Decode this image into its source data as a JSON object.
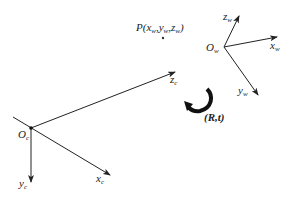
{
  "diagram": {
    "type": "coordinate-frame-transformation",
    "point": {
      "label": "P",
      "coords": "(x_w,y_w,z_w)",
      "text_main": "P(x",
      "sub1": "w",
      "mid1": ",y",
      "sub2": "w",
      "mid2": ",z",
      "sub3": "w",
      "end": ")"
    },
    "camera_frame": {
      "origin": {
        "main": "O",
        "sub": "c"
      },
      "x_axis": {
        "main": "x",
        "sub": "c"
      },
      "y_axis": {
        "main": "y",
        "sub": "c"
      },
      "z_axis": {
        "main": "z",
        "sub": "c"
      }
    },
    "world_frame": {
      "origin": {
        "main": "O",
        "sub": "w"
      },
      "x_axis": {
        "main": "x",
        "sub": "w"
      },
      "y_axis": {
        "main": "y",
        "sub": "w"
      },
      "z_axis": {
        "main": "z",
        "sub": "w"
      }
    },
    "transform": {
      "label": "(R,t)",
      "open": "(",
      "R": "R",
      "comma": ",",
      "t": "t",
      "close": ")"
    },
    "colors": {
      "line": "#222222",
      "background": "#ffffff"
    }
  }
}
